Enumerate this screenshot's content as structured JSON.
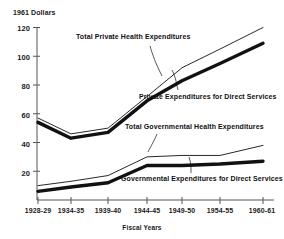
{
  "chart_data": {
    "type": "line",
    "title": "",
    "subtitle": "",
    "ylabel": "1961 Dollars",
    "xlabel": "Fiscal Years",
    "categories": [
      "1928-29",
      "1934-35",
      "1939-40",
      "1944-45",
      "1949-50",
      "1954-55",
      "1960-61"
    ],
    "yticks": [
      20,
      40,
      60,
      80,
      100,
      120
    ],
    "ylim": [
      0,
      120
    ],
    "grid": false,
    "legend_position": "inline-annotations",
    "series": [
      {
        "name": "Total Private Health Expenditures",
        "style": "thin",
        "values": [
          57,
          46,
          50,
          72,
          92,
          105,
          120
        ]
      },
      {
        "name": "Private Expenditures for Direct Services",
        "style": "thick",
        "values": [
          54,
          43,
          47,
          69,
          83,
          95,
          109
        ]
      },
      {
        "name": "Total Governmental Health Expenditures",
        "style": "thin",
        "values": [
          10,
          13,
          17,
          30,
          31,
          31,
          38
        ]
      },
      {
        "name": "Governmental Expenditures for Direct Services",
        "style": "thick",
        "values": [
          6,
          9,
          12,
          24,
          24,
          25,
          27
        ]
      }
    ],
    "annotations": [
      {
        "text": "Total Private Health Expenditures",
        "x": 76,
        "y": 36
      },
      {
        "text": "Private Expenditures for Direct Services",
        "x": 139,
        "y": 96
      },
      {
        "text": "Total Governmental Health Expenditures",
        "x": 125,
        "y": 126
      },
      {
        "text": "Governmental Expenditures for Direct Services",
        "x": 121,
        "y": 178
      }
    ],
    "colors": {
      "line": "#111111",
      "axis": "#444444",
      "text": "#1a1a1a",
      "background": "#ffffff"
    }
  }
}
